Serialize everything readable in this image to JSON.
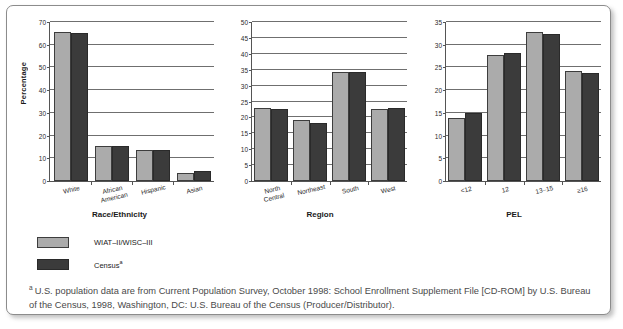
{
  "figure": {
    "series": [
      {
        "key": "s1",
        "label": "WIAT–II/WISC–III",
        "color": "#ababab"
      },
      {
        "key": "s2",
        "label": "Census",
        "color": "#3b3b3b",
        "label_sup": "a"
      }
    ],
    "footnote": {
      "marker": "a",
      "text": "U.S. population data are from Current Population Survey, October 1998: School Enrollment Supplement File [CD-ROM] by U.S. Bureau of the Census, 1998, Washington, DC: U.S. Bureau of the Census (Producer/Distributor)."
    }
  },
  "chart_data": [
    {
      "type": "bar",
      "title": "",
      "xlabel": "Race/Ethnicity",
      "ylabel": "Percentage",
      "categories": [
        "White",
        "African\nAmerican",
        "Hispanic",
        "Asian"
      ],
      "ylim": [
        0,
        70
      ],
      "yticks": [
        0,
        10,
        20,
        30,
        40,
        50,
        60,
        70
      ],
      "grid": true,
      "legend_position": "below-left",
      "series": [
        {
          "name": "WIAT–II/WISC–III",
          "values": [
            65.5,
            15.3,
            13.8,
            3.4
          ]
        },
        {
          "name": "Census",
          "values": [
            65.0,
            15.6,
            13.6,
            4.2
          ]
        }
      ]
    },
    {
      "type": "bar",
      "title": "",
      "xlabel": "Region",
      "ylabel": "",
      "categories": [
        "North\nCentral",
        "Northeast",
        "South",
        "West"
      ],
      "ylim": [
        0,
        50
      ],
      "yticks": [
        0,
        5,
        10,
        15,
        20,
        25,
        30,
        35,
        40,
        45,
        50
      ],
      "grid": true,
      "legend_position": "below-left",
      "series": [
        {
          "name": "WIAT–II/WISC–III",
          "values": [
            23.0,
            19.1,
            34.2,
            22.7
          ]
        },
        {
          "name": "Census",
          "values": [
            22.5,
            18.4,
            34.2,
            23.1
          ]
        }
      ]
    },
    {
      "type": "bar",
      "title": "",
      "xlabel": "PEL",
      "ylabel": "",
      "categories": [
        "<12",
        "12",
        "13–15",
        "≥16"
      ],
      "ylim": [
        0,
        35
      ],
      "yticks": [
        0,
        5,
        10,
        15,
        20,
        25,
        30,
        35
      ],
      "grid": true,
      "legend_position": "below-left",
      "series": [
        {
          "name": "WIAT–II/WISC–III",
          "values": [
            13.8,
            27.8,
            32.9,
            24.2
          ]
        },
        {
          "name": "Census",
          "values": [
            15.0,
            28.1,
            32.3,
            23.7
          ]
        }
      ]
    }
  ]
}
